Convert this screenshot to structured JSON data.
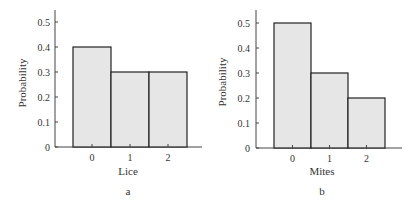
{
  "chart_data": [
    {
      "type": "bar",
      "panel_label": "a",
      "title": "",
      "xlabel": "Lice",
      "ylabel": "Probability",
      "categories": [
        "0",
        "1",
        "2"
      ],
      "values": [
        0.4,
        0.3,
        0.3
      ],
      "yticks": [
        "0",
        "0.1",
        "0.2",
        "0.3",
        "0.4",
        "0.5"
      ],
      "ylim": [
        0,
        0.55
      ],
      "grid": false,
      "bar_fill": "#e6e6e6",
      "bar_edge": "#222222"
    },
    {
      "type": "bar",
      "panel_label": "b",
      "title": "",
      "xlabel": "Mites",
      "ylabel": "Probability",
      "categories": [
        "0",
        "1",
        "2"
      ],
      "values": [
        0.5,
        0.3,
        0.2
      ],
      "yticks": [
        "0",
        "0.1",
        "0.2",
        "0.3",
        "0.4",
        "0.5"
      ],
      "ylim": [
        0,
        0.55
      ],
      "grid": false,
      "bar_fill": "#e6e6e6",
      "bar_edge": "#222222"
    }
  ]
}
